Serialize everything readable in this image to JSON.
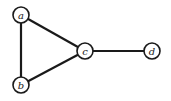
{
  "graph": {
    "nodes": [
      {
        "id": "a",
        "label": "a",
        "x": 21,
        "y": 15
      },
      {
        "id": "b",
        "label": "b",
        "x": 21,
        "y": 85
      },
      {
        "id": "c",
        "label": "c",
        "x": 85,
        "y": 51
      },
      {
        "id": "d",
        "label": "d",
        "x": 152,
        "y": 51
      }
    ],
    "edges": [
      {
        "from": "a",
        "to": "b"
      },
      {
        "from": "a",
        "to": "c"
      },
      {
        "from": "b",
        "to": "c"
      },
      {
        "from": "c",
        "to": "d"
      }
    ],
    "node_radius": 8,
    "stroke_color": "#1a1a1a",
    "fill_color": "#ffffff"
  }
}
